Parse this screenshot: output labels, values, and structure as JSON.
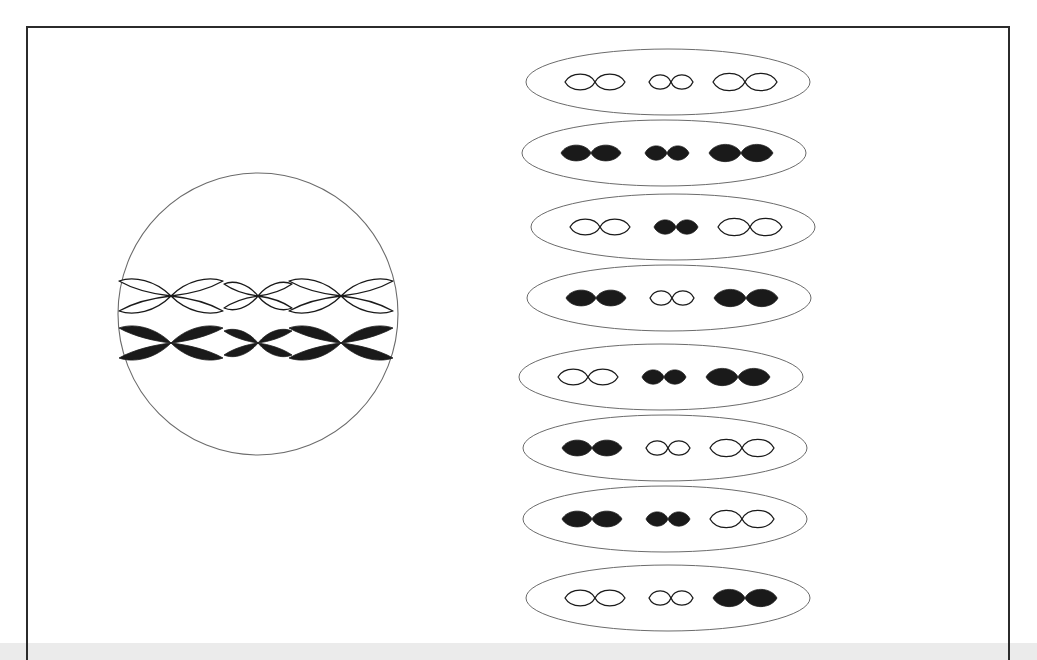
{
  "figure": {
    "background_color": "#ffffff",
    "frame_color": "#2b2b2b",
    "bottom_band_color": "#ebebeb",
    "chromosome_outline_color": "#1a1a1a",
    "chromosome_fill_dark": "#1a1a1a",
    "chromosome_fill_light": "#ffffff",
    "cell_membrane_color": "#6b6b6b"
  },
  "parent_cell": {
    "label": "parent cell at metaphase",
    "shape": "ellipse",
    "rows": [
      {
        "row_label": "upper row of replicated chromosomes",
        "shade": "light",
        "chromosomes": [
          {
            "size": "large",
            "shade": "light",
            "shape": "x"
          },
          {
            "size": "small",
            "shade": "light",
            "shape": "x"
          },
          {
            "size": "large",
            "shade": "light",
            "shape": "x"
          }
        ]
      },
      {
        "row_label": "lower row of replicated chromosomes",
        "shade": "dark",
        "chromosomes": [
          {
            "size": "large",
            "shade": "dark",
            "shape": "x"
          },
          {
            "size": "small",
            "shade": "dark",
            "shape": "x"
          },
          {
            "size": "large",
            "shade": "dark",
            "shape": "x"
          }
        ]
      }
    ]
  },
  "gametes": {
    "label": "resulting gamete cells",
    "count": 8,
    "cells": [
      {
        "index": 1,
        "pattern": [
          "light",
          "light",
          "light"
        ]
      },
      {
        "index": 2,
        "pattern": [
          "dark",
          "dark",
          "dark"
        ]
      },
      {
        "index": 3,
        "pattern": [
          "light",
          "dark",
          "light"
        ]
      },
      {
        "index": 4,
        "pattern": [
          "dark",
          "light",
          "dark"
        ]
      },
      {
        "index": 5,
        "pattern": [
          "light",
          "dark",
          "dark"
        ]
      },
      {
        "index": 6,
        "pattern": [
          "dark",
          "light",
          "light"
        ]
      },
      {
        "index": 7,
        "pattern": [
          "dark",
          "dark",
          "light"
        ]
      },
      {
        "index": 8,
        "pattern": [
          "light",
          "light",
          "dark"
        ]
      }
    ],
    "chromosome_sizes": [
      "large",
      "small",
      "large"
    ],
    "positions_top": [
      47,
      118,
      192,
      263,
      342,
      413,
      484,
      563
    ]
  }
}
